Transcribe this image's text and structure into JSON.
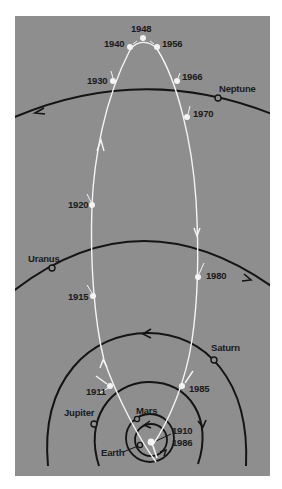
{
  "figure": {
    "colors": {
      "panel": "#8e8e8e",
      "comet_path": "#f4f4f4",
      "orbits": "#141414",
      "labels": "#1a1a1a",
      "page": "#ffffff"
    },
    "planets": [
      {
        "id": "neptune",
        "label": "Neptune"
      },
      {
        "id": "uranus",
        "label": "Uranus"
      },
      {
        "id": "saturn",
        "label": "Saturn"
      },
      {
        "id": "jupiter",
        "label": "Jupiter"
      },
      {
        "id": "mars",
        "label": "Mars"
      },
      {
        "id": "earth",
        "label": "Earth"
      }
    ],
    "comet_positions": [
      {
        "year": "1910",
        "note": "perihelion"
      },
      {
        "year": "1911"
      },
      {
        "year": "1915"
      },
      {
        "year": "1920"
      },
      {
        "year": "1930"
      },
      {
        "year": "1940"
      },
      {
        "year": "1948",
        "note": "aphelion"
      },
      {
        "year": "1956"
      },
      {
        "year": "1966"
      },
      {
        "year": "1970"
      },
      {
        "year": "1980"
      },
      {
        "year": "1985"
      },
      {
        "year": "1986",
        "note": "perihelion"
      }
    ],
    "labels": {
      "y1948": "1948",
      "y1940": "1940",
      "y1956": "1956",
      "y1930": "1930",
      "y1966": "1966",
      "y1970": "1970",
      "y1920": "1920",
      "y1980": "1980",
      "y1915": "1915",
      "y1911": "1911",
      "y1985": "1985",
      "y1910": "1910",
      "y1986": "1986",
      "neptune": "Neptune",
      "uranus": "Uranus",
      "saturn": "Saturn",
      "jupiter": "Jupiter",
      "mars": "Mars",
      "earth": "Earth"
    },
    "caption": " "
  }
}
